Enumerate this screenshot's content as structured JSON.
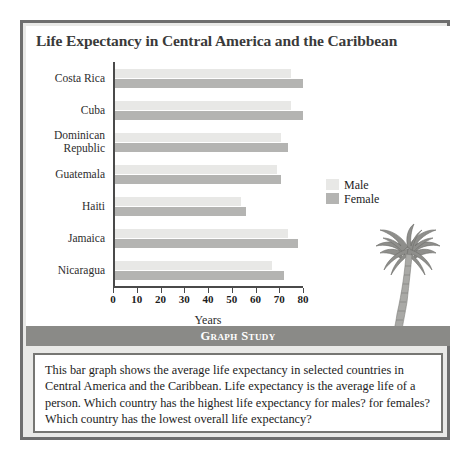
{
  "figure": {
    "title": "Life Expectancy in Central America and the Caribbean",
    "x_axis_title": "Years",
    "legend": {
      "male_label": "Male",
      "female_label": "Female"
    },
    "palm_tree_icon": "palm-tree-icon"
  },
  "study": {
    "banner_label": "Graph Study",
    "body": "This bar graph shows the average life expectancy in selected countries in Central America and the Caribbean. Life expectancy is the average life of a person. Which country has the highest life expectancy for males? for females? Which country has the lowest overall life expectancy?"
  },
  "colors": {
    "male_bar": "#e8e8e6",
    "female_bar": "#b4b4b2",
    "frame": "#6e6e6e",
    "banner": "#8a8a87",
    "panel_background": "#e9e9e7",
    "axis": "#4a4a4a"
  },
  "chart_data": {
    "type": "bar",
    "orientation": "horizontal",
    "title": "Life Expectancy in Central America and the Caribbean",
    "xlabel": "Years",
    "ylabel": "",
    "xlim": [
      0,
      80
    ],
    "xticks": [
      0,
      10,
      20,
      30,
      40,
      50,
      60,
      70,
      80
    ],
    "grid": false,
    "legend_position": "right",
    "categories": [
      "Costa Rica",
      "Cuba",
      "Dominican Republic",
      "Guatemala",
      "Haiti",
      "Jamaica",
      "Nicaragua"
    ],
    "series": [
      {
        "name": "Male",
        "color": "#e8e8e6",
        "values": [
          74,
          74,
          70,
          68,
          53,
          73,
          66
        ]
      },
      {
        "name": "Female",
        "color": "#b4b4b2",
        "values": [
          79,
          79,
          73,
          70,
          55,
          77,
          71
        ]
      }
    ]
  }
}
